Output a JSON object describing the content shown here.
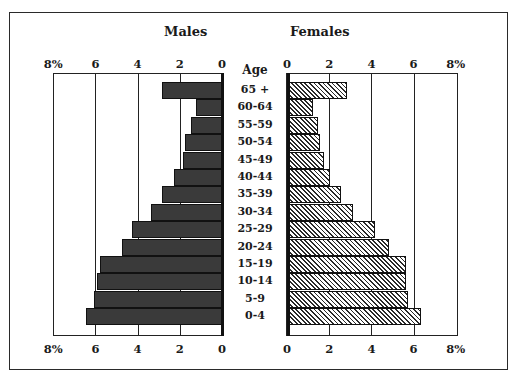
{
  "chart_data": {
    "type": "bar",
    "subtype": "population-pyramid",
    "title": "",
    "left_title": "Males",
    "right_title": "Females",
    "center_label": "Age",
    "categories": [
      "65+",
      "60-64",
      "55-59",
      "50-54",
      "45-49",
      "40-44",
      "35-39",
      "30-34",
      "25-29",
      "20-24",
      "15-19",
      "10-14",
      "5-9",
      "0-4"
    ],
    "series": [
      {
        "name": "Males",
        "values": [
          2.9,
          1.3,
          1.5,
          1.8,
          1.9,
          2.3,
          2.9,
          3.4,
          4.3,
          4.8,
          5.85,
          5.95,
          6.1,
          6.5
        ],
        "pattern": "dark stipple"
      },
      {
        "name": "Females",
        "values": [
          2.8,
          1.2,
          1.4,
          1.5,
          1.7,
          2.0,
          2.5,
          3.1,
          4.1,
          4.8,
          5.6,
          5.6,
          5.7,
          6.3
        ],
        "pattern": "diagonal hatch"
      }
    ],
    "xlabel": "Percent of population",
    "ylabel": "Age",
    "xlim": [
      0,
      8
    ],
    "male_ticks": [
      "8%",
      "6",
      "4",
      "2",
      "0"
    ],
    "female_ticks": [
      "0",
      "2",
      "4",
      "6",
      "8%"
    ],
    "grid": true,
    "legend": "none (side titles)"
  },
  "labels": {
    "males": "Males",
    "females": "Females",
    "age": "Age"
  },
  "colors": {
    "male_fill": "#7a7a7a",
    "female_hatch": "#2a2a2a",
    "border": "#222222"
  }
}
